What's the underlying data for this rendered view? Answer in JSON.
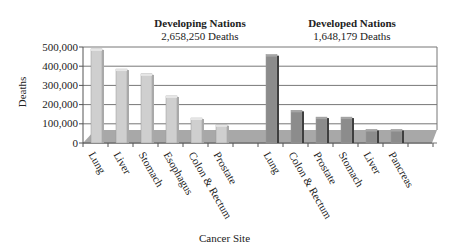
{
  "chart_data": {
    "type": "bar",
    "title": "",
    "xlabel": "Cancer Site",
    "ylabel": "Deaths",
    "ylim": [
      0,
      500000
    ],
    "yticks": [
      "0",
      "100,000",
      "200,000",
      "300,000",
      "400,000",
      "500,000"
    ],
    "grid": true,
    "style": "3d-bar",
    "groups": [
      {
        "name": "Developing Nations",
        "subtitle": "2,658,250 Deaths",
        "color": "#c8c8c8",
        "categories": [
          "Lung",
          "Liver",
          "Stomach",
          "Esophagus",
          "Colon & Rectum",
          "Prostate"
        ],
        "values": [
          490000,
          385000,
          360000,
          245000,
          130000,
          95000
        ]
      },
      {
        "name": "Developed Nations",
        "subtitle": "1,648,179 Deaths",
        "color": "#8a8a8a",
        "categories": [
          "Lung",
          "Colon & Rectum",
          "Prostate",
          "Stomach",
          "Liver",
          "Pancreas"
        ],
        "values": [
          460000,
          170000,
          135000,
          135000,
          70000,
          70000
        ]
      }
    ]
  }
}
